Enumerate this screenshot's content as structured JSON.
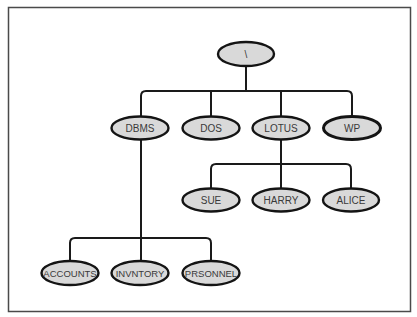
{
  "diagram": {
    "type": "directory-tree",
    "colors": {
      "node_fill": "#d9d9d9",
      "node_stroke": "#141414",
      "edge": "#1a1a1a",
      "frame": "#4a4a4a",
      "background": "#ffffff",
      "label": "#3a3a3a"
    },
    "root": {
      "id": "root",
      "label": "\\"
    },
    "level1": [
      {
        "id": "dbms",
        "label": "DBMS",
        "parent": "root"
      },
      {
        "id": "dos",
        "label": "DOS",
        "parent": "root"
      },
      {
        "id": "lotus",
        "label": "LOTUS",
        "parent": "root"
      },
      {
        "id": "wp",
        "label": "WP",
        "parent": "root"
      }
    ],
    "lotus_children": [
      {
        "id": "sue",
        "label": "SUE",
        "parent": "lotus"
      },
      {
        "id": "harry",
        "label": "HARRY",
        "parent": "lotus"
      },
      {
        "id": "alice",
        "label": "ALICE",
        "parent": "lotus"
      }
    ],
    "dbms_children": [
      {
        "id": "accounts",
        "label": "ACCOUNTS",
        "parent": "dbms"
      },
      {
        "id": "invntory",
        "label": "INVNTORY",
        "parent": "dbms"
      },
      {
        "id": "prsonnel",
        "label": "PRSONNEL",
        "parent": "dbms"
      }
    ]
  }
}
